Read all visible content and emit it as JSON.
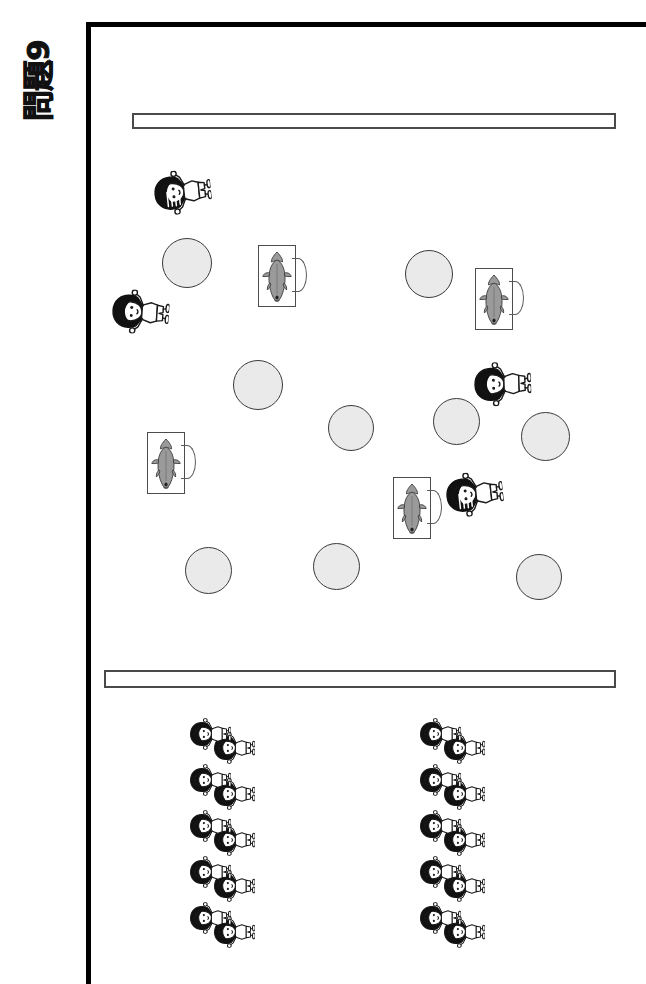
{
  "page": {
    "problem_label": "問題9",
    "background_color": "#ffffff",
    "frame_color": "#000000",
    "width": 646,
    "height": 984
  },
  "banners": [
    {
      "id": "banner-top",
      "text": "",
      "placeholder": ""
    },
    {
      "id": "banner-bottom",
      "text": "",
      "placeholder": ""
    }
  ],
  "colors": {
    "circle_fill": "#eaeaea",
    "circle_stroke": "#3a3a3a",
    "mug_stroke": "#4c4c4c",
    "fish_fill": "#9a9a9a",
    "hair_dark": "#111111",
    "ink": "#1a1a1a"
  },
  "scatter": {
    "circles": [
      {
        "name": "circle-1",
        "x": 162,
        "y": 238,
        "d": 50
      },
      {
        "name": "circle-2",
        "x": 405,
        "y": 250,
        "d": 48
      },
      {
        "name": "circle-3",
        "x": 233,
        "y": 360,
        "d": 50
      },
      {
        "name": "circle-4",
        "x": 328,
        "y": 405,
        "d": 46
      },
      {
        "name": "circle-5",
        "x": 433,
        "y": 398,
        "d": 47
      },
      {
        "name": "circle-6",
        "x": 521,
        "y": 412,
        "d": 49
      },
      {
        "name": "circle-7",
        "x": 185,
        "y": 547,
        "d": 47
      },
      {
        "name": "circle-8",
        "x": 313,
        "y": 543,
        "d": 47
      },
      {
        "name": "circle-9",
        "x": 516,
        "y": 554,
        "d": 46
      }
    ],
    "mugs": [
      {
        "name": "mug-1",
        "x": 258,
        "y": 245,
        "rot": 0
      },
      {
        "name": "mug-2",
        "x": 475,
        "y": 268,
        "rot": 0
      },
      {
        "name": "mug-3",
        "x": 147,
        "y": 432,
        "rot": 0
      },
      {
        "name": "mug-4",
        "x": 393,
        "y": 477,
        "rot": 0
      }
    ],
    "kids": [
      {
        "name": "kid-1",
        "x": 160,
        "y": 163,
        "rot": -96,
        "hair": "striped"
      },
      {
        "name": "kid-2",
        "x": 118,
        "y": 283,
        "rot": -86,
        "hair": "solid"
      },
      {
        "name": "kid-3",
        "x": 480,
        "y": 355,
        "rot": -92,
        "hair": "solid"
      },
      {
        "name": "kid-4",
        "x": 452,
        "y": 465,
        "rot": -96,
        "hair": "striped"
      }
    ]
  },
  "clusters": [
    {
      "name": "cluster-left",
      "x": 188,
      "y": 705,
      "rows": 5,
      "per_row": 2,
      "total": 10
    },
    {
      "name": "cluster-right",
      "x": 418,
      "y": 705,
      "rows": 5,
      "per_row": 2,
      "total": 10
    }
  ],
  "icons": {
    "fish": "fish-icon",
    "mug": "mug-icon",
    "circle": "circle-icon",
    "child": "child-figure-icon"
  }
}
